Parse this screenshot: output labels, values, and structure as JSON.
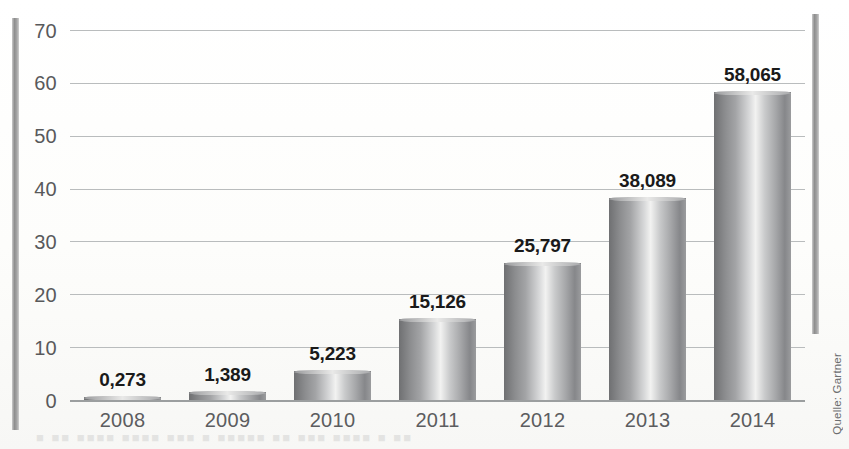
{
  "chart_data": {
    "type": "bar",
    "title": "",
    "subtitle": "",
    "xlabel": "",
    "ylabel": "",
    "categories": [
      "2008",
      "2009",
      "2010",
      "2011",
      "2012",
      "2013",
      "2014"
    ],
    "values": [
      0.273,
      1.389,
      5.223,
      15.126,
      25.797,
      38.089,
      58.065
    ],
    "value_labels": [
      "0,273",
      "1,389",
      "5,223",
      "15,126",
      "25,797",
      "38,089",
      "58,065"
    ],
    "ylim": [
      0,
      70
    ],
    "y_ticks": [
      70,
      60,
      50,
      40,
      30,
      20,
      10,
      0
    ],
    "y_tick_labels": [
      "70",
      "60",
      "50",
      "40",
      "30",
      "20",
      "10",
      "0"
    ],
    "grid": true,
    "legend": false,
    "legend_position": "none",
    "bar_style": "3d-cylinder-grayscale",
    "decimal_separator": "comma"
  },
  "source": {
    "credit": "Quelle: Gartner"
  },
  "colors": {
    "page_background": "#fdfdfc",
    "gridline": "#b9bcbd",
    "baseline": "#9b9e9f",
    "tick_text": "#58595b",
    "value_label_text": "#1a1a1a",
    "bar_light": "#f2f2f1",
    "bar_mid": "#a3a4a6",
    "bar_dark": "#6f7072",
    "edge_rule": "#8e8e8e"
  },
  "artifacts": {
    "bleed_through_text": "■ ■■ ■■■■ ■■■■ ■■■ ■ ■■■■■ ■■ ■■■ ■■■■ ■ ■■"
  }
}
